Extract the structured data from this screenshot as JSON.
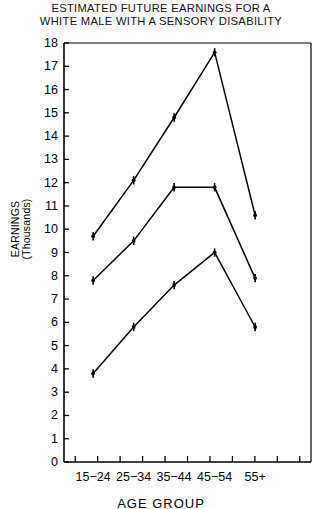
{
  "title": {
    "line1": "ESTIMATED FUTURE EARNINGS FOR A",
    "line2": "WHITE MALE WITH A SENSORY DISABILITY"
  },
  "axes": {
    "ylabel_line1": "EARNINGS",
    "ylabel_line2": "(Thousands)",
    "xlabel": "AGE GROUP",
    "ytick_labels": [
      "18",
      "17",
      "16",
      "15",
      "14",
      "13",
      "12",
      "11",
      "10",
      "9",
      "8",
      "7",
      "6",
      "5",
      "4",
      "3",
      "2",
      "1",
      "0"
    ],
    "xtick_labels": [
      "15−24",
      "25−34",
      "35−44",
      "45−54",
      "55+"
    ]
  },
  "chart_data": {
    "type": "line",
    "title": "ESTIMATED FUTURE EARNINGS FOR A WHITE MALE WITH A SENSORY DISABILITY",
    "xlabel": "AGE GROUP",
    "ylabel": "EARNINGS (Thousands)",
    "categories": [
      "15-24",
      "25-34",
      "35-44",
      "45-54",
      "55+"
    ],
    "ylim": [
      0,
      18
    ],
    "ytick_step": 1,
    "grid": false,
    "legend": "none",
    "marker": "plus-filled",
    "line_color": "#000000",
    "series": [
      {
        "name": "upper",
        "values": [
          9.7,
          12.1,
          14.8,
          17.6,
          10.6
        ]
      },
      {
        "name": "middle",
        "values": [
          7.8,
          9.5,
          11.8,
          11.8,
          7.9
        ]
      },
      {
        "name": "lower",
        "values": [
          3.8,
          5.8,
          7.6,
          9.0,
          5.8
        ]
      }
    ]
  },
  "geometry": {
    "plot_left": 64,
    "plot_right": 311,
    "plot_top": 43,
    "plot_bottom": 462
  }
}
